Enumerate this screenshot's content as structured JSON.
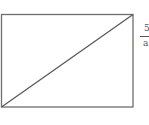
{
  "figure": {
    "shape": "rectangle",
    "rect": {
      "x": 1.5,
      "y": 14.5,
      "width": 131.5,
      "height": 92.5
    },
    "diagonal": {
      "x1": 1.5,
      "y1": 107,
      "x2": 133,
      "y2": 14.5
    },
    "stroke_color": "#6e6e6e"
  },
  "label": {
    "numerator": "5",
    "denominator": "a"
  }
}
